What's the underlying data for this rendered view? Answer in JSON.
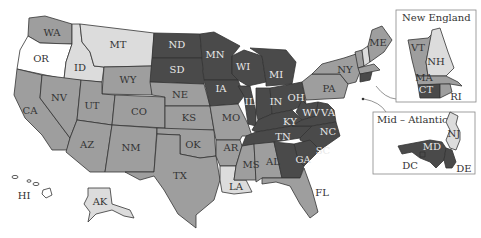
{
  "map": {
    "type": "choropleth",
    "region": "United States",
    "legend": null,
    "shades": {
      "white": "#ffffff",
      "light": "#dcdcdc",
      "medium": "#9e9e9e",
      "dark": "#4a4a4a"
    },
    "states": {
      "WA": {
        "label": "WA",
        "shade": "medium"
      },
      "OR": {
        "label": "OR",
        "shade": "white"
      },
      "CA": {
        "label": "CA",
        "shade": "medium"
      },
      "ID": {
        "label": "ID",
        "shade": "light"
      },
      "NV": {
        "label": "NV",
        "shade": "medium"
      },
      "MT": {
        "label": "MT",
        "shade": "light"
      },
      "WY": {
        "label": "WY",
        "shade": "medium"
      },
      "UT": {
        "label": "UT",
        "shade": "medium"
      },
      "CO": {
        "label": "CO",
        "shade": "medium"
      },
      "AZ": {
        "label": "AZ",
        "shade": "medium"
      },
      "NM": {
        "label": "NM",
        "shade": "medium"
      },
      "ND": {
        "label": "ND",
        "shade": "dark"
      },
      "SD": {
        "label": "SD",
        "shade": "dark"
      },
      "NE": {
        "label": "NE",
        "shade": "medium"
      },
      "KS": {
        "label": "KS",
        "shade": "medium"
      },
      "OK": {
        "label": "OK",
        "shade": "medium"
      },
      "TX": {
        "label": "TX",
        "shade": "medium"
      },
      "MN": {
        "label": "MN",
        "shade": "dark"
      },
      "IA": {
        "label": "IA",
        "shade": "dark"
      },
      "MO": {
        "label": "MO",
        "shade": "medium"
      },
      "AR": {
        "label": "AR",
        "shade": "medium"
      },
      "LA": {
        "label": "LA",
        "shade": "light"
      },
      "WI": {
        "label": "WI",
        "shade": "dark"
      },
      "IL": {
        "label": "IL",
        "shade": "dark"
      },
      "MI": {
        "label": "MI",
        "shade": "dark"
      },
      "IN": {
        "label": "IN",
        "shade": "dark"
      },
      "OH": {
        "label": "OH",
        "shade": "dark"
      },
      "KY": {
        "label": "KY",
        "shade": "dark"
      },
      "TN": {
        "label": "TN",
        "shade": "dark"
      },
      "MS": {
        "label": "MS",
        "shade": "medium"
      },
      "AL": {
        "label": "AL",
        "shade": "medium"
      },
      "GA": {
        "label": "GA",
        "shade": "dark"
      },
      "FL": {
        "label": "FL",
        "shade": "medium"
      },
      "SC": {
        "label": "SC",
        "shade": "dark"
      },
      "NC": {
        "label": "NC",
        "shade": "dark"
      },
      "VA": {
        "label": "VA",
        "shade": "dark"
      },
      "WV": {
        "label": "WV",
        "shade": "dark"
      },
      "PA": {
        "label": "PA",
        "shade": "medium"
      },
      "NY": {
        "label": "NY",
        "shade": "medium"
      },
      "ME": {
        "label": "ME",
        "shade": "medium"
      },
      "VT": {
        "label": "VT",
        "shade": "medium"
      },
      "NH": {
        "label": "NH",
        "shade": "light"
      },
      "MA": {
        "label": "MA",
        "shade": "medium"
      },
      "CT": {
        "label": "CT",
        "shade": "dark"
      },
      "RI": {
        "label": "RI",
        "shade": "medium"
      },
      "NJ": {
        "label": "NJ",
        "shade": "light"
      },
      "DE": {
        "label": "DE",
        "shade": "dark"
      },
      "MD": {
        "label": "MD",
        "shade": "dark"
      },
      "DC": {
        "label": "DC",
        "shade": "dark"
      },
      "HI": {
        "label": "HI",
        "shade": "white"
      },
      "AK": {
        "label": "AK",
        "shade": "light"
      }
    },
    "insets": {
      "new_england": {
        "title": "New England",
        "labels": {
          "VT": "VT",
          "NH": "NH",
          "MA": "MA",
          "CT": "CT",
          "RI": "RI"
        }
      },
      "mid_atlantic": {
        "title": "Mid – Atlantic",
        "labels": {
          "NJ": "NJ",
          "MD": "MD",
          "DC": "DC",
          "DE": "DE"
        }
      }
    }
  }
}
